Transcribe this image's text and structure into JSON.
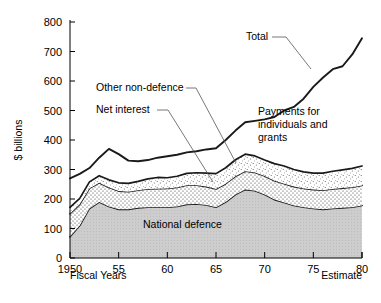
{
  "chart_data": {
    "type": "area",
    "title": "",
    "xlabel": "Fiscal Years",
    "ylabel": "$ billions",
    "ylim": [
      0,
      800
    ],
    "xlim": [
      1950,
      1980
    ],
    "grid": false,
    "legend": "none",
    "y_ticks": [
      "0",
      "100",
      "200",
      "300",
      "400",
      "500",
      "600",
      "700",
      "800"
    ],
    "x_ticks": [
      "1950",
      "55",
      "60",
      "65",
      "70",
      "75",
      "80"
    ],
    "x_tick_values": [
      1950,
      1955,
      1960,
      1965,
      1970,
      1975,
      1980
    ],
    "x": [
      1950,
      1951,
      1952,
      1953,
      1954,
      1955,
      1956,
      1957,
      1958,
      1959,
      1960,
      1961,
      1962,
      1963,
      1964,
      1965,
      1966,
      1967,
      1968,
      1969,
      1970,
      1971,
      1972,
      1973,
      1974,
      1975,
      1976,
      1977,
      1978,
      1979,
      1980
    ],
    "series": [
      {
        "name": "National defence",
        "stack_order": 1,
        "pattern": "solid-gray",
        "values": [
          72,
          110,
          168,
          190,
          175,
          165,
          165,
          170,
          172,
          172,
          172,
          175,
          182,
          183,
          180,
          172,
          190,
          215,
          232,
          228,
          215,
          198,
          188,
          178,
          172,
          168,
          165,
          168,
          170,
          172,
          178
        ]
      },
      {
        "name": "Net interest",
        "stack_order": 2,
        "pattern": "dot-grid",
        "values": [
          78,
          72,
          68,
          65,
          64,
          62,
          60,
          60,
          62,
          63,
          64,
          64,
          65,
          64,
          62,
          62,
          62,
          62,
          62,
          62,
          63,
          64,
          64,
          64,
          64,
          64,
          65,
          66,
          67,
          68,
          68
        ]
      },
      {
        "name": "Other non-defence",
        "stack_order": 3,
        "pattern": "fine-stipple",
        "values": [
          22,
          20,
          22,
          24,
          26,
          28,
          28,
          30,
          34,
          38,
          36,
          38,
          40,
          42,
          46,
          52,
          54,
          56,
          58,
          56,
          54,
          58,
          60,
          58,
          56,
          56,
          58,
          60,
          62,
          64,
          66
        ]
      }
    ],
    "total_line": {
      "name": "Total",
      "values": [
        270,
        285,
        305,
        340,
        370,
        352,
        330,
        328,
        332,
        340,
        345,
        350,
        358,
        362,
        368,
        372,
        400,
        432,
        460,
        465,
        470,
        478,
        500,
        512,
        540,
        580,
        612,
        640,
        650,
        690,
        745
      ]
    },
    "annotations": [
      {
        "name": "total",
        "label": "Total"
      },
      {
        "name": "other-non-defence",
        "label": "Other non-defence"
      },
      {
        "name": "net-interest",
        "label": "Net interest"
      },
      {
        "name": "payments",
        "label_line1": "Payments for",
        "label_line2": "individuals and",
        "label_line3": "grants"
      },
      {
        "name": "national-defence",
        "label": "National defence"
      },
      {
        "name": "estimate",
        "label": "Estimate"
      }
    ],
    "colors": {
      "axis": "#000000",
      "line": "#1a1a1a",
      "defence_fill": "#c9c9c9",
      "interest_fill": "#ffffff",
      "other_fill": "#ffffff",
      "text": "#000000",
      "leader": "#555555"
    }
  }
}
